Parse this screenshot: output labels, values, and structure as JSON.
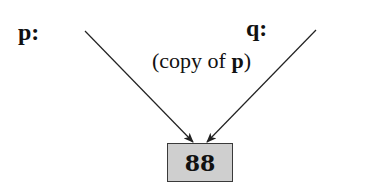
{
  "diagram": {
    "pointers": [
      {
        "name": "p",
        "label": "p:",
        "note": null
      },
      {
        "name": "q",
        "label": "q:",
        "note": {
          "prefix": "(copy of ",
          "bold": "p",
          "suffix": ")"
        }
      }
    ],
    "target": {
      "value": "88"
    },
    "colors": {
      "box_fill": "#cfcfcf",
      "box_border": "#3a3a3a",
      "arrow": "#222222"
    }
  }
}
